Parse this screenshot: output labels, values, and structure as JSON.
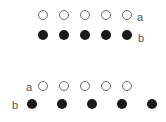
{
  "diagram": {
    "colors": {
      "open_stroke": "#6a6a6a",
      "filled": "#1a1a1a",
      "label": "#555555"
    },
    "groups": [
      {
        "name": "aligned",
        "rows": [
          {
            "label": "a",
            "label_side": "right",
            "style": "open",
            "y": 15,
            "xs": [
              43,
              64,
              85,
              106,
              127
            ],
            "label_x": 140,
            "label_y": 17
          },
          {
            "label": "b",
            "label_side": "right",
            "style": "filled",
            "y": 35,
            "xs": [
              43,
              64,
              85,
              106,
              127
            ],
            "label_x": 141,
            "label_y": 38
          }
        ]
      },
      {
        "name": "misaligned",
        "rows": [
          {
            "label": "a",
            "label_side": "left",
            "style": "open",
            "y": 86,
            "xs": [
              43,
              64,
              85,
              106,
              127
            ],
            "label_x": 29,
            "label_y": 87
          },
          {
            "label": "b",
            "label_side": "left",
            "style": "filled",
            "y": 104,
            "xs": [
              32,
              62,
              92,
              122,
              152
            ],
            "label_x": 15,
            "label_y": 105
          }
        ]
      }
    ]
  }
}
